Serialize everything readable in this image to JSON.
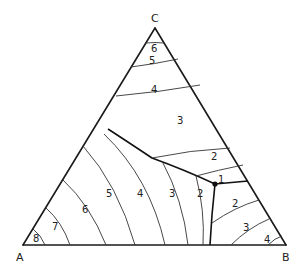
{
  "diagram": {
    "type": "ternary-phase-diagram",
    "vertices": {
      "A": "A",
      "B": "B",
      "C": "C"
    },
    "ternary_point_label": "1",
    "regions": {
      "C_field_isotherms": [
        "6",
        "5",
        "4",
        "3",
        "2"
      ],
      "A_field_isotherms": [
        "8",
        "7",
        "6",
        "5",
        "4",
        "3",
        "2"
      ],
      "B_field_isotherms": [
        "2",
        "3",
        "4"
      ]
    },
    "colors": {
      "line": "#1a1a1a",
      "background": "#ffffff"
    }
  }
}
